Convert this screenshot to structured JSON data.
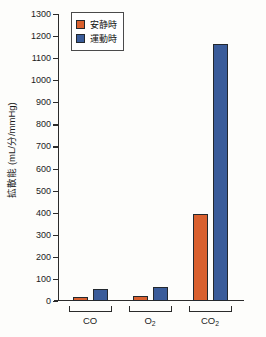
{
  "chart_data": {
    "type": "bar",
    "title": "",
    "xlabel": "",
    "ylabel": "拡散能 (mL/分/mmHg)",
    "categories": [
      "CO",
      "O2",
      "CO2"
    ],
    "category_labels_html": [
      "CO",
      "O<sub>2</sub>",
      "CO<sub>2</sub>"
    ],
    "series": [
      {
        "name": "安静時",
        "color": "#d9602f",
        "values": [
          20,
          21,
          392
        ]
      },
      {
        "name": "運動時",
        "color": "#3a5c9a",
        "values": [
          55,
          63,
          1163
        ]
      }
    ],
    "ylim": [
      0,
      1300
    ],
    "ytick_step": 100,
    "yticks": [
      1300,
      1200,
      1100,
      1000,
      900,
      800,
      700,
      600,
      500,
      400,
      300,
      200,
      100,
      0
    ],
    "ytick_labels": [
      "1300",
      "1200",
      "1100",
      "1000",
      "900",
      "800",
      "700",
      "600",
      "500",
      "400",
      "300",
      "200",
      "100",
      "0"
    ],
    "grid": false,
    "legend_position": "top-left-inside"
  },
  "legend": {
    "entries": [
      {
        "label": "安静時",
        "color": "#d9602f"
      },
      {
        "label": "運動時",
        "color": "#3a5c9a"
      }
    ]
  },
  "colors": {
    "rest": "#d9602f",
    "exercise": "#3a5c9a",
    "axis": "#2b2b2b",
    "background": "#fdfdfb"
  }
}
